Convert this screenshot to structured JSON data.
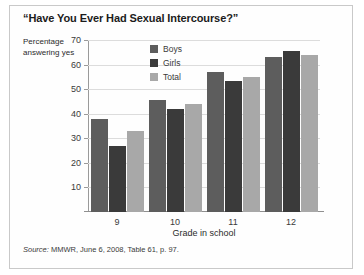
{
  "figure": {
    "title": "“Have You Ever Had Sexual Intercourse?”",
    "source": "MMWR, June 6, 2008, Table 61, p. 97.",
    "source_word": "Source:"
  },
  "chart_data": {
    "type": "bar",
    "title": "“Have You Ever Had Sexual Intercourse?”",
    "xlabel": "Grade in school",
    "ylabel": "Percentage answering yes",
    "categories": [
      "9",
      "10",
      "11",
      "12"
    ],
    "series": [
      {
        "name": "Boys",
        "color": "#5d5d5d",
        "values": [
          38,
          45.5,
          57,
          63
        ]
      },
      {
        "name": "Girls",
        "color": "#3a3a3a",
        "values": [
          27,
          42,
          53.5,
          65.5
        ]
      },
      {
        "name": "Total",
        "color": "#a8a8a8",
        "values": [
          33,
          44,
          55,
          64
        ]
      }
    ],
    "ylim": [
      0,
      70
    ],
    "yticks": [
      10,
      20,
      30,
      40,
      50,
      60,
      70
    ],
    "ytick_labels": [
      "10",
      "20",
      "30",
      "40",
      "50",
      "60",
      "70"
    ],
    "grid": true,
    "legend_position": "top-center"
  }
}
